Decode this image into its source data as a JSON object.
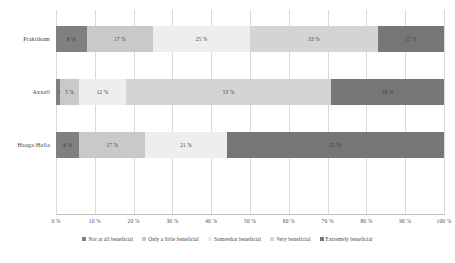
{
  "chart_data": {
    "type": "bar",
    "orientation": "horizontal",
    "stacked": true,
    "stack_mode": "percent",
    "title": "",
    "xlabel": "",
    "ylabel": "",
    "xlim": [
      0,
      100
    ],
    "grid": true,
    "legend_position": "bottom",
    "categories": [
      "Praktikum",
      "Axxell",
      "Haaga-Helia"
    ],
    "tick_labels": [
      "0 %",
      "10 %",
      "20 %",
      "30 %",
      "40 %",
      "50 %",
      "60 %",
      "70 %",
      "80 %",
      "90 %",
      "100 %"
    ],
    "tick_values": [
      0,
      10,
      20,
      30,
      40,
      50,
      60,
      70,
      80,
      90,
      100
    ],
    "series": [
      {
        "name": "Not at all beneficial",
        "color": "#808080",
        "values": [
          8,
          1,
          6
        ],
        "labels": [
          "8 %",
          "1 %",
          "6 %"
        ]
      },
      {
        "name": "Only a little beneficial",
        "color": "#c9c9c9",
        "values": [
          17,
          5,
          17
        ],
        "labels": [
          "17 %",
          "5 %",
          "17 %"
        ]
      },
      {
        "name": "Somewhat beneficial",
        "color": "#eeeeee",
        "values": [
          25,
          12,
          21
        ],
        "labels": [
          "25 %",
          "12 %",
          "21 %"
        ]
      },
      {
        "name": "Very beneficial",
        "color": "#d4d4d4",
        "values": [
          33,
          53,
          0
        ],
        "labels": [
          "33 %",
          "53 %",
          ""
        ]
      },
      {
        "name": "Extremely beneficial",
        "color": "#767676",
        "values": [
          17,
          29,
          56
        ],
        "labels": [
          "17 %",
          "29 %",
          "55 %"
        ]
      }
    ]
  }
}
